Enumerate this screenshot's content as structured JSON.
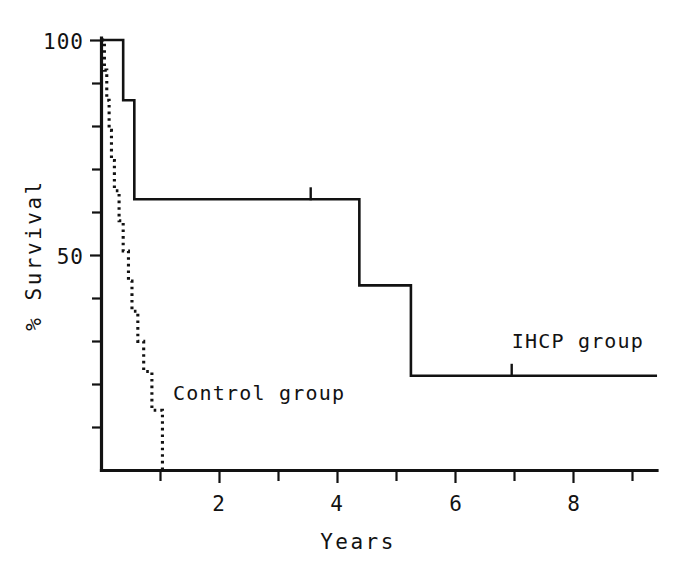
{
  "chart_data": {
    "type": "line",
    "subtype": "kaplan-meier-step",
    "title": "",
    "subtitle": "",
    "xlabel": "Years",
    "ylabel": "% Survival",
    "xlim": [
      0,
      9.5
    ],
    "ylim": [
      0,
      100
    ],
    "grid": false,
    "legend_position": "inline-annotation",
    "x_ticks": [
      0,
      1,
      2,
      3,
      4,
      5,
      6,
      7,
      8,
      9
    ],
    "x_tick_labels": [
      "",
      "",
      "2",
      "",
      "4",
      "",
      "6",
      "",
      "8",
      ""
    ],
    "x_major_labels": [
      "2",
      "4",
      "6",
      "8"
    ],
    "y_ticks": [
      0,
      10,
      20,
      30,
      40,
      50,
      60,
      70,
      80,
      90,
      100
    ],
    "y_tick_labels": [
      "",
      "",
      "",
      "",
      "",
      "50",
      "",
      "",
      "",
      "",
      "100"
    ],
    "y_major_labels": [
      "50",
      "100"
    ],
    "series": [
      {
        "name": "IHCP group",
        "label": "IHCP group",
        "style": "solid",
        "label_x": 7.0,
        "label_y": 28.5,
        "points": [
          {
            "x": 0.0,
            "y": 100
          },
          {
            "x": 0.37,
            "y": 100
          },
          {
            "x": 0.37,
            "y": 86
          },
          {
            "x": 0.56,
            "y": 86
          },
          {
            "x": 0.56,
            "y": 63
          },
          {
            "x": 4.4,
            "y": 63
          },
          {
            "x": 4.4,
            "y": 43
          },
          {
            "x": 5.28,
            "y": 43
          },
          {
            "x": 5.28,
            "y": 22
          },
          {
            "x": 9.48,
            "y": 22
          }
        ],
        "censored": [
          {
            "x": 3.57,
            "y": 63
          },
          {
            "x": 7.0,
            "y": 22
          }
        ]
      },
      {
        "name": "Control group",
        "label": "Control group",
        "style": "dotted",
        "label_x": 1.22,
        "label_y": 16.5,
        "points": [
          {
            "x": 0.0,
            "y": 100
          },
          {
            "x": 0.05,
            "y": 100
          },
          {
            "x": 0.05,
            "y": 93
          },
          {
            "x": 0.09,
            "y": 93
          },
          {
            "x": 0.09,
            "y": 86
          },
          {
            "x": 0.13,
            "y": 86
          },
          {
            "x": 0.13,
            "y": 79
          },
          {
            "x": 0.17,
            "y": 79
          },
          {
            "x": 0.17,
            "y": 72
          },
          {
            "x": 0.22,
            "y": 72
          },
          {
            "x": 0.22,
            "y": 65
          },
          {
            "x": 0.3,
            "y": 65
          },
          {
            "x": 0.3,
            "y": 58
          },
          {
            "x": 0.37,
            "y": 58
          },
          {
            "x": 0.37,
            "y": 51
          },
          {
            "x": 0.46,
            "y": 51
          },
          {
            "x": 0.46,
            "y": 44
          },
          {
            "x": 0.52,
            "y": 44
          },
          {
            "x": 0.52,
            "y": 37
          },
          {
            "x": 0.62,
            "y": 37
          },
          {
            "x": 0.62,
            "y": 30
          },
          {
            "x": 0.72,
            "y": 30
          },
          {
            "x": 0.72,
            "y": 23
          },
          {
            "x": 0.86,
            "y": 23
          },
          {
            "x": 0.86,
            "y": 14
          },
          {
            "x": 1.04,
            "y": 14
          },
          {
            "x": 1.04,
            "y": 0
          }
        ],
        "censored": []
      }
    ]
  },
  "axes": {
    "y_label": "% Survival",
    "x_label": "Years",
    "y_top_label": "100",
    "y_mid_label": "50",
    "x_labels": [
      "2",
      "4",
      "6",
      "8"
    ]
  },
  "annotations": {
    "ihcp_label": "IHCP group",
    "control_label": "Control group"
  },
  "colors": {
    "ink": "#121212",
    "background": "#ffffff"
  }
}
